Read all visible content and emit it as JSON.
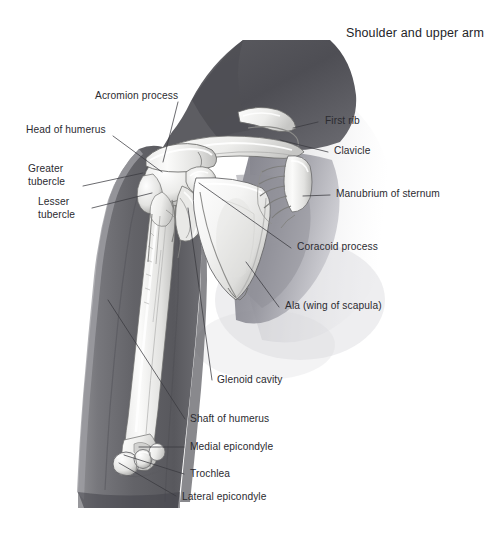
{
  "figure": {
    "title": "Shoulder and upper arm",
    "background_color": "#ffffff",
    "text_color": "#2b2b30",
    "leader_line_color": "#3a3a3f",
    "illustration_style": "grayscale pencil anatomical drawing"
  },
  "labels": [
    {
      "id": "acromion-process",
      "text": "Acromion process",
      "x": 95,
      "y": 90,
      "align": "left",
      "anchor_x": 178,
      "anchor_y": 102,
      "target_x": 163,
      "target_y": 162
    },
    {
      "id": "head-of-humerus",
      "text": "Head of humerus",
      "x": 26,
      "y": 124,
      "align": "left",
      "anchor_x": 113,
      "anchor_y": 136,
      "target_x": 162,
      "target_y": 172
    },
    {
      "id": "greater-tubercle",
      "line1": "Greater",
      "line2": "tubercle",
      "x": 28,
      "y": 163,
      "align": "left",
      "anchor_x": 83,
      "anchor_y": 186,
      "target_x": 143,
      "target_y": 173
    },
    {
      "id": "lesser-tubercle",
      "line1": "Lesser",
      "line2": "tubercle",
      "x": 38,
      "y": 196,
      "align": "left",
      "anchor_x": 92,
      "anchor_y": 208,
      "target_x": 152,
      "target_y": 193
    },
    {
      "id": "first-rib",
      "text": "First rib",
      "x": 325,
      "y": 115,
      "align": "left",
      "anchor_x": 318,
      "anchor_y": 122,
      "target_x": 293,
      "target_y": 128
    },
    {
      "id": "clavicle",
      "text": "Clavicle",
      "x": 334,
      "y": 145,
      "align": "left",
      "anchor_x": 328,
      "anchor_y": 152,
      "target_x": 280,
      "target_y": 140
    },
    {
      "id": "manubrium-of-sternum",
      "text": "Manubrium of sternum",
      "x": 336,
      "y": 188,
      "align": "left",
      "anchor_x": 330,
      "anchor_y": 195,
      "target_x": 303,
      "target_y": 196
    },
    {
      "id": "coracoid-process",
      "text": "Coracoid process",
      "x": 297,
      "y": 241,
      "align": "left",
      "anchor_x": 291,
      "anchor_y": 248,
      "target_x": 199,
      "target_y": 183
    },
    {
      "id": "ala-wing-of-scapula",
      "text": "Ala (wing of scapula)",
      "x": 285,
      "y": 300,
      "align": "left",
      "anchor_x": 279,
      "anchor_y": 307,
      "target_x": 246,
      "target_y": 262
    },
    {
      "id": "glenoid-cavity",
      "text": "Glenoid cavity",
      "x": 217,
      "y": 374,
      "align": "left",
      "anchor_x": 212,
      "anchor_y": 380,
      "target_x": 188,
      "target_y": 208
    },
    {
      "id": "shaft-of-humerus",
      "text": "Shaft of humerus",
      "x": 190,
      "y": 413,
      "align": "left",
      "anchor_x": 185,
      "anchor_y": 419,
      "target_x": 108,
      "target_y": 300
    },
    {
      "id": "medial-epicondyle",
      "text": "Medial epicondyle",
      "x": 190,
      "y": 441,
      "align": "left",
      "anchor_x": 184,
      "anchor_y": 447,
      "target_x": 139,
      "target_y": 447
    },
    {
      "id": "trochlea",
      "text": "Trochlea",
      "x": 190,
      "y": 468,
      "align": "left",
      "anchor_x": 184,
      "anchor_y": 474,
      "target_x": 124,
      "target_y": 455
    },
    {
      "id": "lateral-epicondyle",
      "text": "Lateral epicondyle",
      "x": 182,
      "y": 491,
      "align": "left",
      "anchor_x": 176,
      "anchor_y": 496,
      "target_x": 119,
      "target_y": 463
    }
  ]
}
